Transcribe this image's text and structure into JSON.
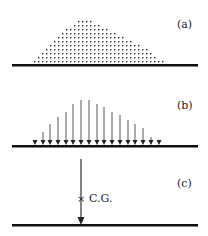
{
  "figure": {
    "panels": [
      {
        "label": "(a)",
        "description": "distributed particles (dots) on ground"
      },
      {
        "label": "(b)",
        "description": "distributed load arrows on ground"
      },
      {
        "label": "(c)",
        "description": "resultant force through center of gravity"
      }
    ],
    "cg_label": "C.G.",
    "cg_marker": "×",
    "colors": {
      "ink": "#111111",
      "arrow": "#555555"
    },
    "arrows_b": {
      "x": [
        35,
        43,
        50,
        58,
        66,
        73,
        81,
        89,
        97,
        104,
        112,
        120,
        128,
        135,
        143,
        151,
        159
      ],
      "top": [
        140,
        132,
        124,
        117,
        112,
        104,
        100,
        100,
        104,
        107,
        112,
        115,
        120,
        124,
        128,
        137,
        140
      ]
    },
    "dots_a": {
      "rows": [
        {
          "y": 21,
          "x0": 78,
          "x1": 90
        },
        {
          "y": 25,
          "x0": 74,
          "x1": 98
        },
        {
          "y": 29,
          "x0": 66,
          "x1": 106
        },
        {
          "y": 33,
          "x0": 62,
          "x1": 114
        },
        {
          "y": 37,
          "x0": 58,
          "x1": 122
        },
        {
          "y": 41,
          "x0": 54,
          "x1": 130
        },
        {
          "y": 45,
          "x0": 50,
          "x1": 138
        },
        {
          "y": 49,
          "x0": 46,
          "x1": 146
        },
        {
          "y": 53,
          "x0": 42,
          "x1": 150
        },
        {
          "y": 57,
          "x0": 38,
          "x1": 154
        },
        {
          "y": 61,
          "x0": 34,
          "x1": 162
        }
      ],
      "spacing": 4
    }
  }
}
